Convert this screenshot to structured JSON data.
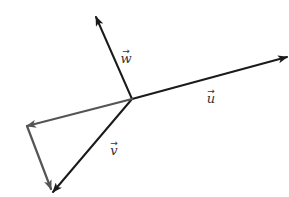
{
  "diagram": {
    "type": "vector-diagram",
    "origin": {
      "x": 132,
      "y": 99
    },
    "colors": {
      "dark": "#1a1a1a",
      "gray": "#555555",
      "label": "#333333"
    },
    "vectors": [
      {
        "id": "u",
        "label": "u",
        "from": [
          132,
          99
        ],
        "to": [
          287,
          57
        ],
        "color": "#1a1a1a",
        "label_pos": [
          207,
          103
        ]
      },
      {
        "id": "w",
        "label": "w",
        "from": [
          132,
          99
        ],
        "to": [
          96,
          17
        ],
        "color": "#1a1a1a",
        "label_pos": [
          122,
          63
        ]
      },
      {
        "id": "v",
        "label": "v",
        "from": [
          132,
          99
        ],
        "to": [
          53,
          192
        ],
        "color": "#1a1a1a",
        "label_pos": [
          110,
          155
        ]
      },
      {
        "id": "helper-1",
        "label": "",
        "from": [
          132,
          99
        ],
        "to": [
          27,
          126
        ],
        "color": "#555555"
      },
      {
        "id": "helper-2",
        "label": "",
        "from": [
          27,
          126
        ],
        "to": [
          51,
          189
        ],
        "color": "#555555"
      }
    ],
    "arrow_glyph": "→"
  }
}
